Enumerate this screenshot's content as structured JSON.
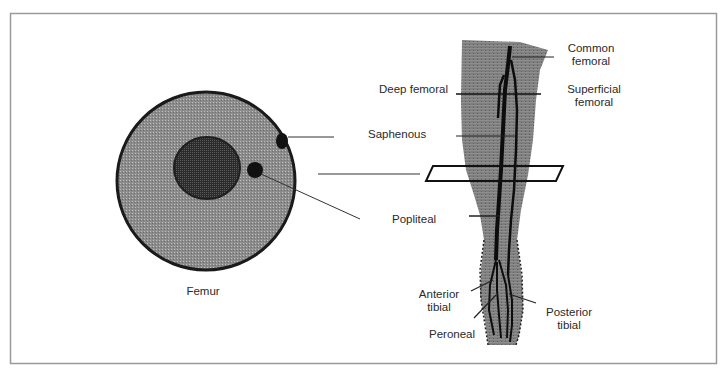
{
  "figure": {
    "cross_section": {
      "caption": "Femur",
      "colors": {
        "tissue": "#8f8f8f",
        "outline": "#1a1a1a",
        "bone": "#2b2b2b",
        "vessel": "#111111"
      }
    },
    "leg": {
      "colors": {
        "tissue": "#7d7d7d",
        "vessel": "#0d0d0d",
        "plane": "#111111"
      },
      "labels": {
        "common_femoral_1": "Common",
        "common_femoral_2": "femoral",
        "superficial_femoral_1": "Superficial",
        "superficial_femoral_2": "femoral",
        "deep_femoral": "Deep femoral",
        "saphenous": "Saphenous",
        "popliteal": "Popliteal",
        "anterior_tibial_1": "Anterior",
        "anterior_tibial_2": "tibial",
        "posterior_tibial_1": "Posterior",
        "posterior_tibial_2": "tibial",
        "peroneal": "Peroneal"
      }
    },
    "frame_color": "#9a9a9a"
  }
}
